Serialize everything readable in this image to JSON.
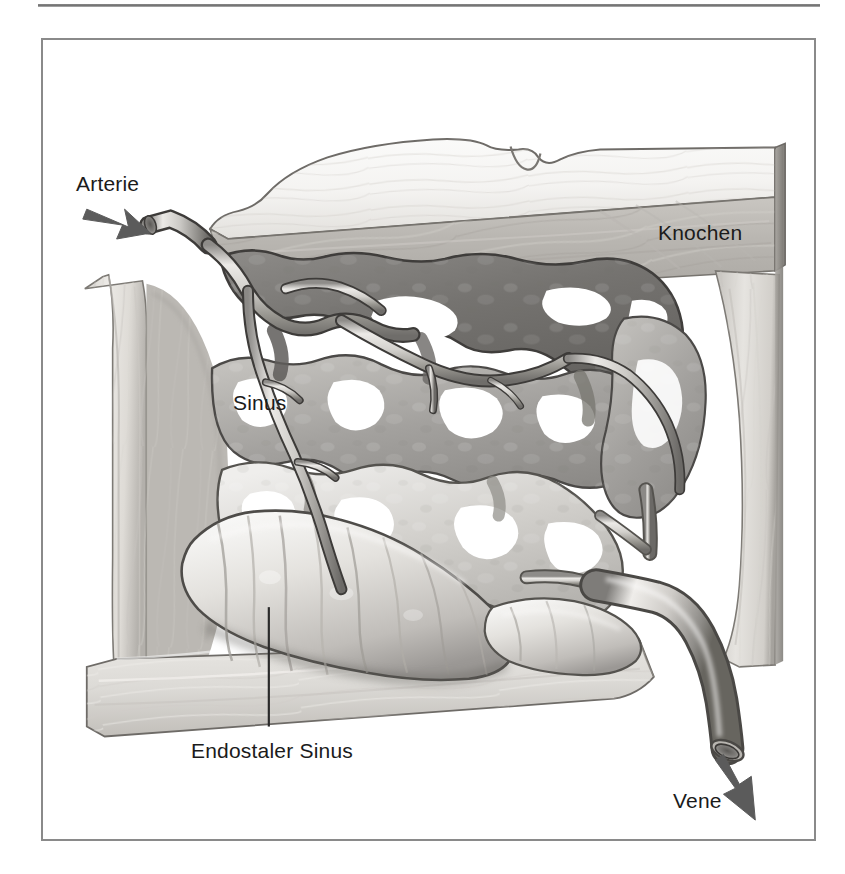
{
  "figure": {
    "kind": "medical-illustration",
    "language": "de",
    "frame": {
      "border_color": "#8a8a8a",
      "background_color": "#ffffff",
      "top_rule_color": "#6f6f6f"
    },
    "palette": {
      "bone_light": "#e8e6e2",
      "bone_mid": "#bdbab5",
      "bone_shadow": "#8e8b86",
      "sinus_dark": "#6e6c6a",
      "sinus_mid": "#9b9997",
      "sinus_light": "#cfcdc9",
      "vessel_outline": "#4a4a4a",
      "vessel_highlight": "#f2f1ef",
      "arrow_color": "#5b5b5b",
      "label_color": "#1b1b1b",
      "leader_line_color": "#2a2a2a"
    },
    "labels": [
      {
        "id": "arterie",
        "text": "Arterie",
        "marker": "arrow",
        "marker_direction": "down-right"
      },
      {
        "id": "knochen",
        "text": "Knochen",
        "marker": "none",
        "marker_direction": ""
      },
      {
        "id": "sinus",
        "text": "Sinus",
        "marker": "none",
        "marker_direction": ""
      },
      {
        "id": "endostaler-sinus",
        "text": "Endostaler Sinus",
        "marker": "leader",
        "marker_direction": "up"
      },
      {
        "id": "vene",
        "text": "Vene",
        "marker": "arrow",
        "marker_direction": "down-right"
      }
    ],
    "anatomy_parts": [
      "Kortikaler Knochenblock (oben)",
      "Knochenwand links",
      "Knochenwand rechts",
      "Knochenplatte unten",
      "Sinusoidales Netzwerk",
      "Endostaler Sinus",
      "Zufuehrende Arterie",
      "Abfuehrende Vene"
    ]
  }
}
